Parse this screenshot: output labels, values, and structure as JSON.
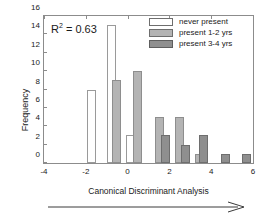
{
  "chart_data": {
    "type": "bar",
    "title": "",
    "xlabel": "Canonical Discriminant Analysis",
    "ylabel": "Frequency",
    "xlim": [
      -4,
      6
    ],
    "ylim": [
      0,
      16
    ],
    "xticks": [
      -4,
      -2,
      0,
      2,
      4,
      6
    ],
    "yticks": [
      0,
      2,
      4,
      6,
      8,
      10,
      12,
      14,
      16
    ],
    "grid": false,
    "legend_position": "top-right",
    "annotation": {
      "text": "R",
      "superscript": "2",
      "rest": " = 0.63",
      "full": "R2 = 0.63"
    },
    "arrow_annotation": {
      "direction": "right",
      "label": ""
    },
    "series": [
      {
        "name": "never present",
        "color": "#ffffff",
        "edge": "#9a9a9a",
        "bars": [
          {
            "x": -1.75,
            "value": 8
          },
          {
            "x": -0.75,
            "value": 15
          },
          {
            "x": 0.15,
            "value": 3
          }
        ]
      },
      {
        "name": "present 1-2 yrs",
        "color": "#b4b4b4",
        "edge": "#8e8e8e",
        "bars": [
          {
            "x": -0.55,
            "value": 9
          },
          {
            "x": 0.45,
            "value": 10
          },
          {
            "x": 1.55,
            "value": 5
          },
          {
            "x": 2.5,
            "value": 5
          },
          {
            "x": 3.45,
            "value": 1
          }
        ]
      },
      {
        "name": "present 3-4 yrs",
        "color": "#8f8f8f",
        "edge": "#6e6e6e",
        "bars": [
          {
            "x": 1.8,
            "value": 3
          },
          {
            "x": 2.75,
            "value": 2
          },
          {
            "x": 3.65,
            "value": 3
          },
          {
            "x": 4.7,
            "value": 1
          },
          {
            "x": 5.7,
            "value": 1
          }
        ]
      }
    ]
  },
  "legend": {
    "items": [
      {
        "label": "never present"
      },
      {
        "label": "present 1-2 yrs"
      },
      {
        "label": "present 3-4 yrs"
      }
    ]
  }
}
